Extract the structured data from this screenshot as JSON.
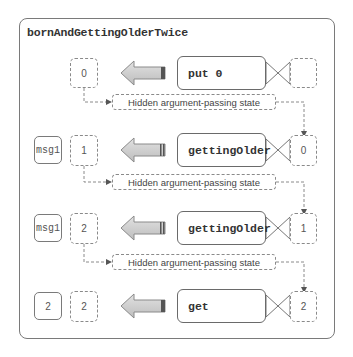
{
  "diagram": {
    "title": "bornAndGettingOlderTwice",
    "hidden_state_label": "Hidden argument-passing state",
    "rows": [
      {
        "message": null,
        "output_state": "0",
        "function": "put 0",
        "input_state": ""
      },
      {
        "message": "msg1",
        "output_state": "1",
        "function": "gettingOlder",
        "input_state": "0"
      },
      {
        "message": "msg1",
        "output_state": "2",
        "function": "gettingOlder",
        "input_state": "1"
      },
      {
        "message": "2",
        "output_state": "2",
        "function": "get",
        "input_state": "2"
      }
    ],
    "hidden_states": [
      {
        "label": "Hidden argument-passing state"
      },
      {
        "label": "Hidden argument-passing state"
      },
      {
        "label": "Hidden argument-passing state"
      }
    ],
    "colors": {
      "frame_border": "#7a7a7a",
      "arrow_fill": "#d0d0d0",
      "arrow_stroke": "#8a8a8a",
      "arrow_tail": "#555555",
      "dashed": "#8a8a8a",
      "text": "#333333"
    }
  }
}
